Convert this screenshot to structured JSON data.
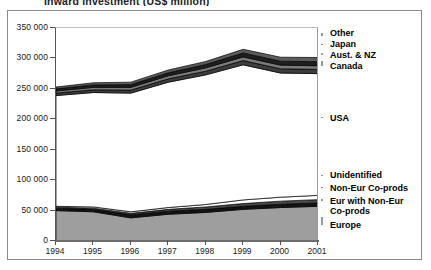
{
  "chart": {
    "title": "Inward investment (US$ million)"
  },
  "chart_data": {
    "type": "area",
    "title": "Inward investment (US$ million)",
    "xlabel": "",
    "ylabel": "",
    "ylim": [
      0,
      350000
    ],
    "ytick_labels": [
      "0",
      "50 000",
      "100 000",
      "150 000",
      "200 000",
      "250 000",
      "300 000",
      "350 000"
    ],
    "ytick_values": [
      0,
      50000,
      100000,
      150000,
      200000,
      250000,
      300000,
      350000
    ],
    "grid": true,
    "legend_position": "right-outside",
    "categories": [
      "1994",
      "1995",
      "1996",
      "1997",
      "1998",
      "1999",
      "2000",
      "2001"
    ],
    "x": [
      1994,
      1995,
      1996,
      1997,
      1998,
      1999,
      2000,
      2001
    ],
    "stacked": true,
    "series": [
      {
        "name": "Europe",
        "color": "#9e9e9e",
        "values": [
          50000,
          48000,
          38000,
          44000,
          47000,
          52000,
          55000,
          57000
        ]
      },
      {
        "name": "Eur with Non-Eur Co-prods",
        "color": "#141414",
        "values": [
          4000,
          4000,
          5000,
          5000,
          5000,
          5000,
          5500,
          5500
        ]
      },
      {
        "name": "Non-Eur Co-prods",
        "color": "#4a4a4a",
        "values": [
          1500,
          2000,
          2500,
          3000,
          4000,
          4500,
          5000,
          5500
        ]
      },
      {
        "name": "Unidentified",
        "color": "#ffffff",
        "values": [
          1500,
          2000,
          2500,
          3000,
          4000,
          6000,
          6500,
          7000
        ]
      },
      {
        "name": "USA",
        "color": "#ffffff",
        "values": [
          182000,
          188000,
          195000,
          206000,
          213000,
          222000,
          204000,
          200000
        ]
      },
      {
        "name": "Canada",
        "color": "#3d3d3d",
        "values": [
          4000,
          4500,
          5000,
          5500,
          6000,
          7000,
          7000,
          7000
        ]
      },
      {
        "name": "Aust. & NZ",
        "color": "#7a7a7a",
        "values": [
          3500,
          4000,
          4500,
          5000,
          5500,
          6000,
          6000,
          6000
        ]
      },
      {
        "name": "Japan",
        "color": "#1f1f1f",
        "values": [
          3500,
          4000,
          4500,
          5000,
          5500,
          6500,
          6500,
          6500
        ]
      },
      {
        "name": "Other",
        "color": "#5c5c5c",
        "values": [
          3000,
          3500,
          4000,
          4500,
          5000,
          6000,
          6500,
          7000
        ]
      }
    ],
    "totals": [
      253000,
      260000,
      261000,
      281000,
      295000,
      315000,
      302000,
      301500
    ],
    "labels_right": [
      "Other",
      "Japan",
      "Aust. & NZ",
      "Canada",
      "USA",
      "Unidentified",
      "Non-Eur Co-prods",
      "Eur with Non-Eur Co-prods",
      "Europe"
    ]
  }
}
